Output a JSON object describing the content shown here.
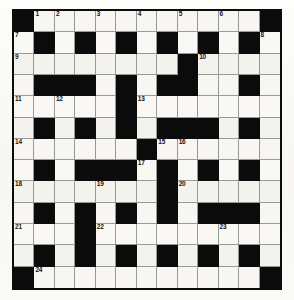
{
  "puzzle": {
    "title": "Crossword Grid",
    "type": "crossword",
    "rows": 13,
    "cols": 13,
    "colors": {
      "block": "#0b0b0b",
      "cell": "#f6f5f1",
      "grid_line": "#9a9a94",
      "frame": "#0c0c0c",
      "paper": "#fbfbf9",
      "number_text": "#141414"
    },
    "legend": {
      "block_char": "#",
      "open_char": "."
    },
    "layout": [
      "#...........#",
      ".#.#.#.#.#.#.",
      "........#....",
      ".###.#.##..#.",
      ".....#.......",
      ".#.#.#.###.#.",
      "......#......",
      ".#.###.#.#.#.",
      ".......#.....",
      ".#.#.#.#.###.",
      "...#.......,.",
      ".#.#.#.#.#.#.",
      "#...........#"
    ],
    "clue_numbers": [
      {
        "n": 1,
        "row": 0,
        "col": 1
      },
      {
        "n": 2,
        "row": 0,
        "col": 2
      },
      {
        "n": 3,
        "row": 0,
        "col": 4
      },
      {
        "n": 4,
        "row": 0,
        "col": 6
      },
      {
        "n": 5,
        "row": 0,
        "col": 8
      },
      {
        "n": 6,
        "row": 0,
        "col": 10
      },
      {
        "n": 7,
        "row": 1,
        "col": 0
      },
      {
        "n": 8,
        "row": 1,
        "col": 12
      },
      {
        "n": 9,
        "row": 2,
        "col": 0
      },
      {
        "n": 10,
        "row": 2,
        "col": 9
      },
      {
        "n": 11,
        "row": 4,
        "col": 0
      },
      {
        "n": 12,
        "row": 4,
        "col": 2
      },
      {
        "n": 13,
        "row": 4,
        "col": 6
      },
      {
        "n": 14,
        "row": 6,
        "col": 0
      },
      {
        "n": 15,
        "row": 6,
        "col": 7
      },
      {
        "n": 16,
        "row": 6,
        "col": 8
      },
      {
        "n": 17,
        "row": 7,
        "col": 6
      },
      {
        "n": 18,
        "row": 8,
        "col": 0
      },
      {
        "n": 19,
        "row": 8,
        "col": 4
      },
      {
        "n": 20,
        "row": 8,
        "col": 8
      },
      {
        "n": 21,
        "row": 10,
        "col": 0
      },
      {
        "n": 22,
        "row": 10,
        "col": 4
      },
      {
        "n": 23,
        "row": 10,
        "col": 10
      },
      {
        "n": 24,
        "row": 12,
        "col": 1
      }
    ],
    "blocks": [
      [
        0,
        0
      ],
      [
        0,
        12
      ],
      [
        1,
        1
      ],
      [
        1,
        3
      ],
      [
        1,
        5
      ],
      [
        1,
        7
      ],
      [
        1,
        9
      ],
      [
        1,
        11
      ],
      [
        2,
        8
      ],
      [
        3,
        1
      ],
      [
        3,
        2
      ],
      [
        3,
        3
      ],
      [
        3,
        5
      ],
      [
        3,
        7
      ],
      [
        3,
        8
      ],
      [
        3,
        11
      ],
      [
        4,
        5
      ],
      [
        5,
        1
      ],
      [
        5,
        3
      ],
      [
        5,
        5
      ],
      [
        5,
        7
      ],
      [
        5,
        8
      ],
      [
        5,
        9
      ],
      [
        5,
        11
      ],
      [
        6,
        6
      ],
      [
        7,
        1
      ],
      [
        7,
        3
      ],
      [
        7,
        4
      ],
      [
        7,
        5
      ],
      [
        7,
        7
      ],
      [
        7,
        9
      ],
      [
        7,
        11
      ],
      [
        8,
        7
      ],
      [
        9,
        1
      ],
      [
        9,
        3
      ],
      [
        9,
        5
      ],
      [
        9,
        7
      ],
      [
        9,
        9
      ],
      [
        9,
        10
      ],
      [
        9,
        11
      ],
      [
        10,
        3
      ],
      [
        11,
        1
      ],
      [
        11,
        3
      ],
      [
        11,
        5
      ],
      [
        11,
        7
      ],
      [
        11,
        9
      ],
      [
        11,
        11
      ],
      [
        12,
        0
      ],
      [
        12,
        12
      ]
    ]
  }
}
